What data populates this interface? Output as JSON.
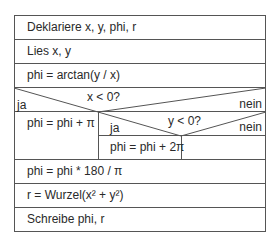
{
  "diagram": {
    "type": "Nassi-Shneiderman structogram",
    "statements_top": [
      "Deklariere x, y, phi, r",
      "Lies x, y",
      "phi  = arctan(y / x)"
    ],
    "outer_condition": {
      "condition": "x < 0?",
      "yes_label": "ja",
      "no_label": "nein",
      "yes_branch": "phi = phi + π",
      "no_branch": {
        "condition": "y < 0?",
        "yes_label": "ja",
        "no_label": "nein",
        "yes_branch": "phi = phi + 2π",
        "no_branch": ""
      }
    },
    "statements_bottom": [
      "phi = phi * 180 / π",
      "r = Wurzel(x² + y²)",
      "Schreibe phi, r"
    ]
  },
  "colors": {
    "line": "#555555",
    "text": "#2a2a2a",
    "background": "#ffffff"
  }
}
